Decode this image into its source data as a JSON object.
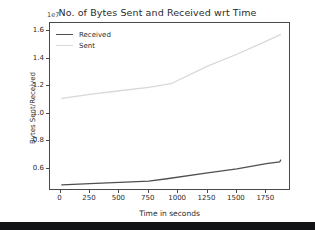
{
  "figure": {
    "background_color": "#ffffff",
    "frame_color": "#4a4a4a"
  },
  "bottom_bar": {
    "color": "#111315"
  },
  "chart_data": {
    "type": "line",
    "title": "No. of Bytes Sent and Received wrt Time",
    "xlabel": "Time in seconds",
    "ylabel": "Bytes Sent/Received",
    "exponent_label": "1e7",
    "y_scale_factor": 10000000,
    "grid": false,
    "legend_position": "upper left",
    "xlim": [
      -90,
      1960
    ],
    "ylim": [
      4400000,
      16600000
    ],
    "xticks": [
      0,
      250,
      500,
      750,
      1000,
      1250,
      1500,
      1750
    ],
    "xtick_labels": [
      "0",
      "250",
      "500",
      "750",
      "1000",
      "1250",
      "1500",
      "1750"
    ],
    "yticks": [
      6000000,
      8000000,
      10000000,
      12000000,
      14000000,
      16000000
    ],
    "ytick_labels": [
      "0.6",
      "0.8",
      "1.0",
      "1.2",
      "1.4",
      "1.6"
    ],
    "series": [
      {
        "name": "Received",
        "color": "#4f4f52",
        "x": [
          10,
          250,
          500,
          750,
          905,
          1250,
          1500,
          1750,
          1865,
          1872
        ],
        "values": [
          4850000,
          4930000,
          5020000,
          5120000,
          5290000,
          5720000,
          6000000,
          6380000,
          6520000,
          6640000
        ]
      },
      {
        "name": "Sent",
        "color": "#d8d8da",
        "x": [
          10,
          250,
          500,
          750,
          940,
          1250,
          1500,
          1750,
          1870
        ],
        "values": [
          11130000,
          11420000,
          11680000,
          11930000,
          12190000,
          13470000,
          14330000,
          15280000,
          15750000
        ]
      }
    ]
  },
  "legend": {
    "entries": [
      {
        "label": "Received",
        "color": "#4f4f52"
      },
      {
        "label": "Sent",
        "color": "#d8d8da"
      }
    ]
  }
}
